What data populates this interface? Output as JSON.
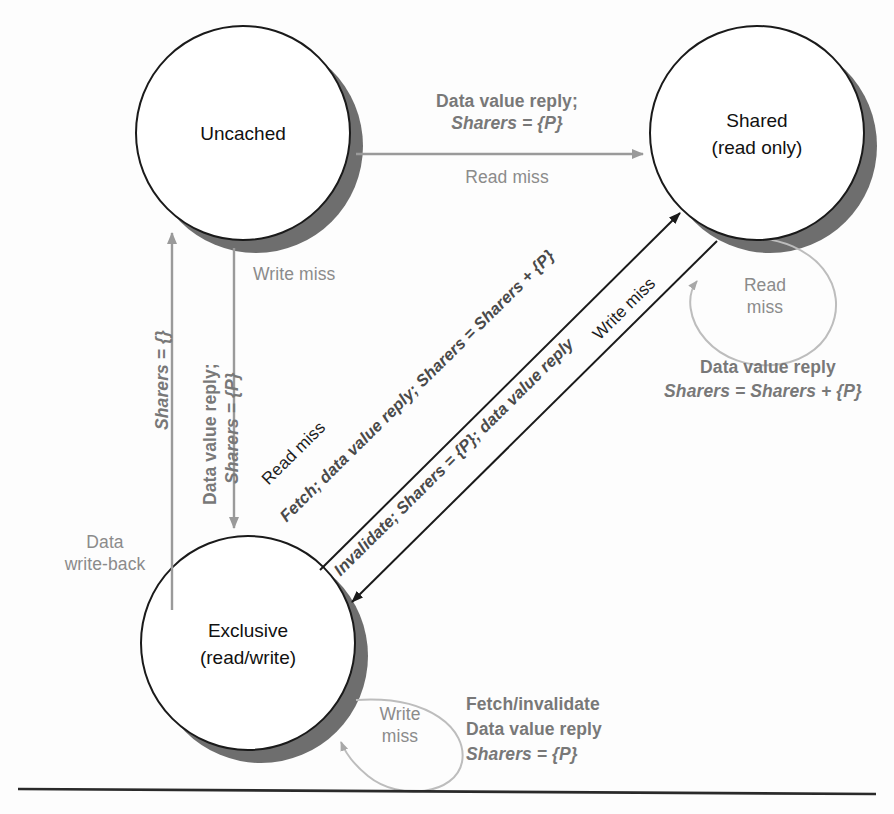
{
  "figure": {
    "type": "state-transition-diagram",
    "states": [
      {
        "id": "uncached",
        "name": "Uncached",
        "sublabel": "",
        "cx": 243,
        "cy": 133,
        "r": 107
      },
      {
        "id": "shared",
        "name": "Shared",
        "sublabel": "(read only)",
        "cx": 757,
        "cy": 133,
        "r": 107
      },
      {
        "id": "exclusive",
        "name": "Exclusive",
        "sublabel": "(read/write)",
        "cx": 248,
        "cy": 643,
        "r": 107
      }
    ],
    "transitions": [
      {
        "id": "uncached-to-shared",
        "from": "Uncached",
        "to": "Shared",
        "event": "Read miss",
        "action_line1": "Data value reply;",
        "action_line2": "Sharers = {P}"
      },
      {
        "id": "uncached-to-exclusive",
        "from": "Uncached",
        "to": "Exclusive",
        "event": "Write miss",
        "action_line1": "Data value reply;",
        "action_line2": "Sharers = {P}"
      },
      {
        "id": "exclusive-to-uncached",
        "from": "Exclusive",
        "to": "Uncached",
        "event": "Data write-back",
        "action_line1": "Sharers = {}",
        "action_line2": ""
      },
      {
        "id": "exclusive-to-shared",
        "from": "Exclusive",
        "to": "Shared",
        "event": "Read miss",
        "action_line1": "Fetch; data value reply; Sharers = Sharers + {P}",
        "action_line2": ""
      },
      {
        "id": "shared-to-exclusive",
        "from": "Shared",
        "to": "Exclusive",
        "event": "Write miss",
        "action_line1": "Invalidate; Sharers = {P}; data value reply",
        "action_line2": ""
      },
      {
        "id": "shared-self-loop",
        "from": "Shared",
        "to": "Shared",
        "event": "Read miss",
        "action_line1": "Data value reply",
        "action_line2": "Sharers = Sharers + {P}"
      },
      {
        "id": "exclusive-self-loop",
        "from": "Exclusive",
        "to": "Exclusive",
        "event": "Write miss",
        "action_line1": "Fetch/invalidate",
        "action_line2": "Data value reply",
        "action_line3": "Sharers = {P}"
      }
    ]
  },
  "labels": {
    "top_action_line1": "Data value reply;",
    "top_action_line2": "Sharers = {P}",
    "top_event": "Read miss",
    "write_miss_left": "Write miss",
    "left_sharers_empty": "Sharers = {}",
    "left_action_line1": "Data value reply;",
    "left_action_line2": "Sharers = {P}",
    "data_write_back_line1": "Data",
    "data_write_back_line2": "write-back",
    "diag_read_miss": "Read miss",
    "diag_fetch_action": "Fetch; data value reply; Sharers = Sharers + {P}",
    "diag_write_miss": "Write miss",
    "diag_invalidate_action": "Invalidate; Sharers = {P}; data value reply",
    "shared_loop_event_line1": "Read",
    "shared_loop_event_line2": "miss",
    "shared_loop_action_line1": "Data value reply",
    "shared_loop_action_line2": "Sharers = Sharers + {P}",
    "exclusive_loop_event_line1": "Write",
    "exclusive_loop_event_line2": "miss",
    "exclusive_loop_action_line1": "Fetch/invalidate",
    "exclusive_loop_action_line2": "Data value reply",
    "exclusive_loop_action_line3": "Sharers = {P}",
    "state_uncached": "Uncached",
    "state_shared": "Shared",
    "state_shared_sub": "(read only)",
    "state_exclusive": "Exclusive",
    "state_exclusive_sub": "(read/write)"
  },
  "colors": {
    "background": "#fdfdfd",
    "circle_stroke": "#1a1a1a",
    "circle_fill": "#ffffff",
    "shadow": "#6e6e6e",
    "gray_text": "#8b8b8b",
    "gray_bold_text": "#787878",
    "dark_text": "#1c1c1c",
    "arrow_gray": "#9a9a9a",
    "arrow_dark": "#1a1a1a",
    "loop_stroke": "#bdbdbd",
    "rule": "#2a2a2a"
  }
}
